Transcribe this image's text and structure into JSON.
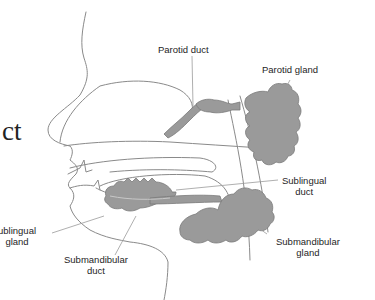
{
  "diagram": {
    "cropped_text_fragment": "ct",
    "colors": {
      "gland_fill": "#9a9a9a",
      "gland_stroke": "#7a7a7a",
      "outline": "#8a8a8a",
      "leader_line": "#9a9a9a",
      "label_text": "#1e1e1e"
    },
    "labels": {
      "parotid_duct": "Parotid duct",
      "parotid_gland": "Parotid gland",
      "sublingual_duct_1": "Sublingual",
      "sublingual_duct_2": "duct",
      "sublingual_gland_1": "ublingual",
      "sublingual_gland_2": "gland",
      "submandibular_duct_1": "Submandibular",
      "submandibular_duct_2": "duct",
      "submandibular_gland_1": "Submandibular",
      "submandibular_gland_2": "gland"
    }
  }
}
